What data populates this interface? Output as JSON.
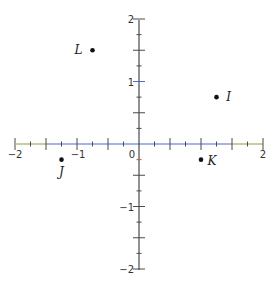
{
  "chart_data": {
    "type": "scatter",
    "title": "",
    "xlabel": "",
    "ylabel": "",
    "xlim": [
      -2,
      2
    ],
    "ylim": [
      -2,
      2
    ],
    "grid": false,
    "x_tick_labels": [
      {
        "value": -2,
        "label": "−2"
      },
      {
        "value": -1,
        "label": "−1"
      },
      {
        "value": 0,
        "label": "0"
      },
      {
        "value": 2,
        "label": "2"
      }
    ],
    "y_tick_labels": [
      {
        "value": 2,
        "label": "2"
      },
      {
        "value": 1,
        "label": "1"
      },
      {
        "value": -1,
        "label": "−1"
      },
      {
        "value": -2,
        "label": "−2"
      }
    ],
    "major_tick_step": 0.5,
    "minor_tick_step": 0.25,
    "points": [
      {
        "name": "L",
        "x": -0.75,
        "y": 1.5
      },
      {
        "name": "I",
        "x": 1.25,
        "y": 0.75
      },
      {
        "name": "J",
        "x": -1.25,
        "y": -0.25
      },
      {
        "name": "K",
        "x": 1.0,
        "y": -0.25
      }
    ]
  },
  "colors": {
    "axis": "#4a4a4a",
    "x_axis_center": "#5566cc",
    "x_axis_ends": "#a8a860",
    "point": "#111111"
  }
}
